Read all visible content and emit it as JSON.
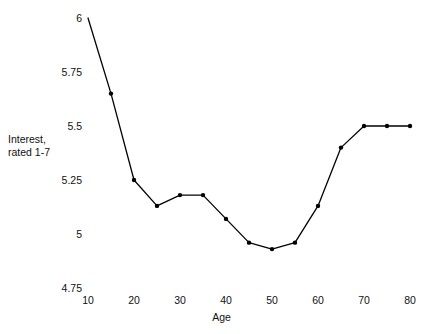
{
  "chart_data": {
    "type": "line",
    "title": "",
    "xlabel": "Age",
    "ylabel": "Interest,\nrated 1-7",
    "ylabel_line1": "Interest,",
    "ylabel_line2": "rated 1-7",
    "x": [
      10,
      15,
      20,
      25,
      30,
      35,
      40,
      45,
      50,
      55,
      60,
      65,
      70,
      75,
      80
    ],
    "values": [
      6.0,
      5.65,
      5.25,
      5.13,
      5.18,
      5.18,
      5.07,
      4.96,
      4.93,
      4.96,
      5.13,
      5.4,
      5.5,
      5.5,
      5.5
    ],
    "series": [
      {
        "name": "Interest",
        "values": [
          6.0,
          5.65,
          5.25,
          5.13,
          5.18,
          5.18,
          5.07,
          4.96,
          4.93,
          4.96,
          5.13,
          5.4,
          5.5,
          5.5,
          5.5
        ]
      }
    ],
    "xlim": [
      10,
      80
    ],
    "ylim": [
      4.75,
      6.0
    ],
    "xticks": [
      "10",
      "20",
      "30",
      "40",
      "50",
      "60",
      "70",
      "80"
    ],
    "xtick_values": [
      10,
      20,
      30,
      40,
      50,
      60,
      70,
      80
    ],
    "yticks": [
      "4.75",
      "5",
      "5.25",
      "5.5",
      "5.75",
      "6"
    ],
    "ytick_values": [
      4.75,
      5.0,
      5.25,
      5.5,
      5.75,
      6.0
    ],
    "grid": false,
    "legend": null,
    "marker": "circle",
    "line_color": "#000000",
    "marker_color": "#000000",
    "background": "#ffffff"
  }
}
